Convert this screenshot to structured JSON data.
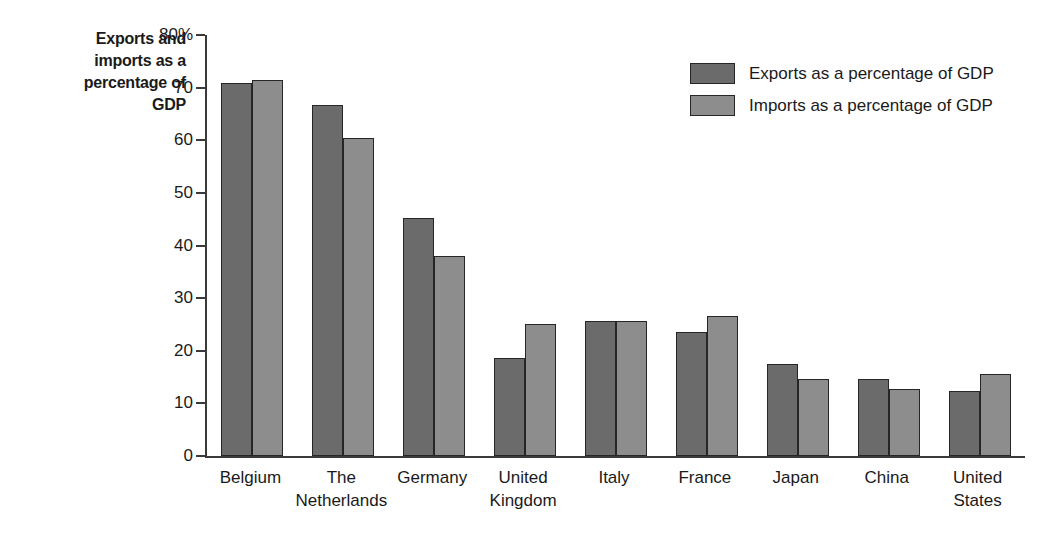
{
  "chart_data": {
    "type": "bar",
    "title": "Exports and imports as a percentage of GDP",
    "title_lines": [
      "Exports and",
      "imports as a",
      "percentage of",
      "GDP"
    ],
    "xlabel": "",
    "ylabel": "Exports and imports as a percentage of GDP",
    "ylim": [
      0,
      80
    ],
    "ytick_step": 10,
    "grid": false,
    "legend_position": "top-right",
    "categories": [
      "Belgium",
      "The Netherlands",
      "Germany",
      "United Kingdom",
      "Italy",
      "France",
      "Japan",
      "China",
      "United States"
    ],
    "category_lines": [
      [
        "Belgium"
      ],
      [
        "The",
        "Netherlands"
      ],
      [
        "Germany"
      ],
      [
        "United",
        "Kingdom"
      ],
      [
        "Italy"
      ],
      [
        "France"
      ],
      [
        "Japan"
      ],
      [
        "China"
      ],
      [
        "United",
        "States"
      ]
    ],
    "ytick_labels": [
      "80%",
      "70",
      "60",
      "50",
      "40",
      "30",
      "20",
      "10",
      "0"
    ],
    "ytick_values": [
      80,
      70,
      60,
      50,
      40,
      30,
      20,
      10,
      0
    ],
    "series": [
      {
        "name": "Exports as a percentage of GDP",
        "color": "#6b6b6b",
        "values": [
          70.8,
          66.7,
          45.3,
          18.6,
          25.7,
          23.5,
          17.5,
          14.7,
          12.4
        ]
      },
      {
        "name": "Imports as a percentage of GDP",
        "color": "#8d8d8d",
        "values": [
          71.4,
          60.4,
          38.0,
          25.0,
          25.7,
          26.7,
          14.6,
          12.7,
          15.5
        ]
      }
    ]
  },
  "legend": {
    "items": [
      {
        "label": "Exports as a percentage of GDP",
        "color": "#6b6b6b"
      },
      {
        "label": "Imports as a percentage of GDP",
        "color": "#8d8d8d"
      }
    ]
  },
  "colors": {
    "exports": "#6b6b6b",
    "imports": "#8d8d8d",
    "axis": "#3a3a3a",
    "bar_outline": "#262626",
    "text": "#1a1a1a",
    "background": "#ffffff"
  }
}
